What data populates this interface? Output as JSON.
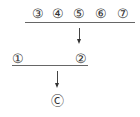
{
  "diagram": {
    "top_row": {
      "nodes": [
        {
          "label": "③",
          "x": 38,
          "y": 14
        },
        {
          "label": "④",
          "x": 58,
          "y": 14
        },
        {
          "label": "⑤",
          "x": 79,
          "y": 14
        },
        {
          "label": "⑥",
          "x": 101,
          "y": 14
        },
        {
          "label": "⑦",
          "x": 123,
          "y": 14
        }
      ],
      "line": {
        "x1": 25,
        "x2": 135,
        "y": 22
      },
      "arrow": {
        "x": 79,
        "y1": 28,
        "y2": 42
      }
    },
    "middle_row": {
      "nodes": [
        {
          "label": "①",
          "x": 18,
          "y": 59
        },
        {
          "label": "②",
          "x": 81,
          "y": 59
        }
      ],
      "line": {
        "x1": 12,
        "x2": 88,
        "y": 65
      },
      "arrow": {
        "x": 57,
        "y1": 71,
        "y2": 86
      }
    },
    "result": {
      "label": "Ⓒ",
      "x": 57,
      "y": 101
    }
  }
}
